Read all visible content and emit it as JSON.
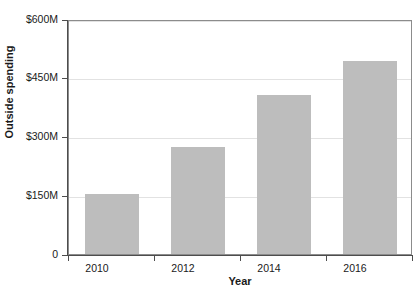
{
  "chart_data": {
    "type": "bar",
    "title": "",
    "categories": [
      "2010",
      "2012",
      "2014",
      "2016"
    ],
    "values": [
      152,
      272,
      407,
      493
    ],
    "value_unit": "$M",
    "xlabel": "Year",
    "ylabel": "Outside spending",
    "ylim": [
      0,
      600
    ],
    "ytick_values": [
      0,
      150,
      300,
      450,
      600
    ],
    "ytick_labels": [
      "0",
      "$150M",
      "$300M",
      "$450M",
      "$600M"
    ],
    "xtick_labels": [
      "2010",
      "2012",
      "2014",
      "2016"
    ],
    "grid": "horizontal",
    "legend": "none",
    "series": [
      {
        "name": "Outside spending",
        "color": "#bdbdbd",
        "values": [
          152,
          272,
          407,
          493
        ]
      }
    ]
  },
  "axes": {
    "y": {
      "title": "Outside spending",
      "ticks": [
        {
          "label": "$600M",
          "value": 600
        },
        {
          "label": "$450M",
          "value": 450
        },
        {
          "label": "$300M",
          "value": 300
        },
        {
          "label": "$150M",
          "value": 150
        },
        {
          "label": "0",
          "value": 0
        }
      ]
    },
    "x": {
      "title": "Year",
      "ticks": [
        {
          "label": "2010"
        },
        {
          "label": "2012"
        },
        {
          "label": "2014"
        },
        {
          "label": "2016"
        }
      ]
    }
  },
  "colors": {
    "bar_fill": "#bdbdbd",
    "gridline": "#e2e2e2",
    "axis_line": "#4d4d4d",
    "plot_border": "#8c8c8c",
    "text": "#1a1a1a",
    "background": "#ffffff"
  },
  "header": {
    "clipped_title": ""
  }
}
